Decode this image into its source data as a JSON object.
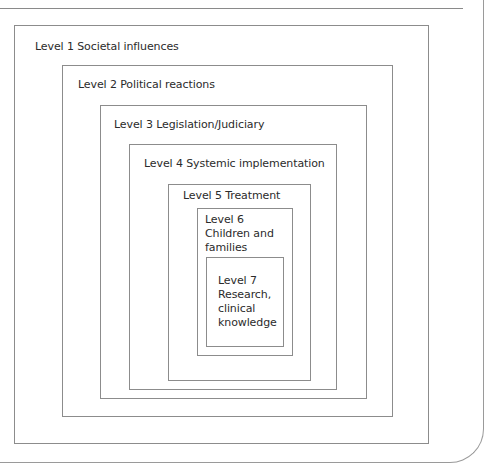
{
  "diagram": {
    "type": "nested-levels",
    "levels": [
      {
        "level": 1,
        "label": "Level 1 Societal influences"
      },
      {
        "level": 2,
        "label": "Level 2 Political reactions"
      },
      {
        "level": 3,
        "label": "Level 3 Legislation/Judiciary"
      },
      {
        "level": 4,
        "label": "Level 4 Systemic implementation"
      },
      {
        "level": 5,
        "label": "Level 5 Treatment"
      },
      {
        "level": 6,
        "label_lines": [
          "Level 6",
          "Children and",
          "families"
        ]
      },
      {
        "level": 7,
        "label_lines": [
          "Level 7",
          "Research,",
          "clinical",
          "knowledge"
        ]
      }
    ]
  },
  "colors": {
    "line": "#8c8c8c",
    "text": "#2b2b2b",
    "background": "#ffffff"
  }
}
